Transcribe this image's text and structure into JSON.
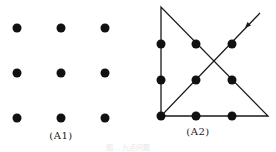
{
  "figure": {
    "panels": [
      {
        "label": "(A1)",
        "label_pos": [
          61,
          130
        ],
        "dots": [
          [
            17,
            28
          ],
          [
            61,
            28
          ],
          [
            105,
            28
          ],
          [
            17,
            73
          ],
          [
            61,
            73
          ],
          [
            105,
            73
          ],
          [
            17,
            118
          ],
          [
            61,
            118
          ],
          [
            105,
            118
          ]
        ]
      },
      {
        "label": "(A2)",
        "label_pos": [
          198,
          126
        ],
        "dots": [
          [
            161,
            44
          ],
          [
            196,
            44
          ],
          [
            232,
            44
          ],
          [
            161,
            80
          ],
          [
            196,
            80
          ],
          [
            232,
            80
          ],
          [
            161,
            116
          ],
          [
            196,
            116
          ],
          [
            232,
            116
          ]
        ],
        "path": [
          [
            260,
            13
          ],
          [
            161,
            116
          ],
          [
            268,
            116
          ],
          [
            161,
            7
          ],
          [
            161,
            116
          ]
        ],
        "arrow": {
          "tip": [
            245,
            28
          ],
          "from": [
            260,
            13
          ]
        }
      }
    ],
    "caption": "图… 九点问题",
    "caption_pos": [
      128,
      142
    ],
    "colors": {
      "ink": "#111111",
      "line": "#1a1a1a"
    },
    "dot_radius": 4.5
  }
}
